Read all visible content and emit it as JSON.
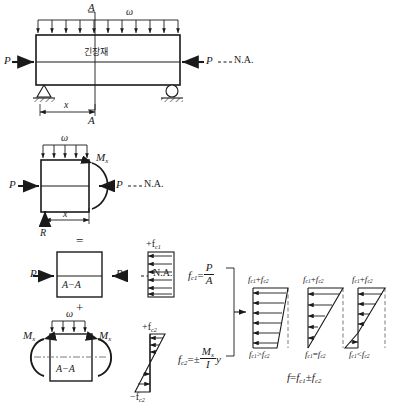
{
  "figure": {
    "line_color": "#1a1a1a",
    "dash_color": "#6b6b6b"
  },
  "beam_top": {
    "load_label": "ω",
    "section_label_top": "A",
    "section_label_bottom": "A",
    "tendon_label": "긴장재",
    "force_left": "P",
    "force_right": "P",
    "neutral_axis": "N.A.",
    "dimension": "x",
    "load_arrow_count": 11
  },
  "freebody": {
    "load_label": "ω",
    "moment_label": "M",
    "moment_sub": "x",
    "force_left": "P",
    "force_right": "P",
    "neutral_axis": "N.A.",
    "dimension": "x",
    "reaction": "R"
  },
  "operators": {
    "equals": "=",
    "plus": "+"
  },
  "axial_case": {
    "section_label": "A−A",
    "force_left": "P",
    "force_right": "P",
    "neutral_axis": "N.A.",
    "stress_label": "+f",
    "stress_sub": "c1",
    "arrow_count": 6
  },
  "bending_case": {
    "load_label": "ω",
    "section_label": "A−A",
    "moment_left": "M",
    "moment_left_sub": "x",
    "moment_right": "M",
    "moment_right_sub": "x",
    "stress_top": "+f",
    "stress_top_sub": "c2",
    "stress_bottom": "−f",
    "stress_bottom_sub": "c2",
    "arrow_count": 5
  },
  "formulas": {
    "axial": {
      "lhs": "f",
      "lhs_sub": "c1",
      "eq": "=",
      "num": "P",
      "den": "A"
    },
    "bending": {
      "lhs": "f",
      "lhs_sub": "c2",
      "eq": "=",
      "sign": "±",
      "num": "M",
      "num_sub": "x",
      "den": "I",
      "tail": "y"
    },
    "result": {
      "lhs": "f",
      "eq": "=",
      "t1": "f",
      "t1_sub": "c1",
      "op": "±",
      "t2": "f",
      "t2_sub": "c2"
    }
  },
  "results": [
    {
      "id": "case-a",
      "top_label": "f",
      "top_sub1": "c1",
      "top_op": "+",
      "top_sub2": "c2",
      "top_term2": "f",
      "bottom_left": "f",
      "bottom_left_sub": "c1",
      "bottom_rel": ">",
      "bottom_right": "f",
      "bottom_right_sub": "c2",
      "shape": "trapezoid-all-compression",
      "arrow_count": 6
    },
    {
      "id": "case-b",
      "top_label": "f",
      "top_sub1": "c1",
      "top_op": "+",
      "top_sub2": "c2",
      "top_term2": "f",
      "bottom_left": "f",
      "bottom_left_sub": "c1",
      "bottom_rel": "=",
      "bottom_right": "f",
      "bottom_right_sub": "c2",
      "shape": "triangle-zero-at-bottom",
      "arrow_count": 5
    },
    {
      "id": "case-c",
      "top_label": "f",
      "top_sub1": "c1",
      "top_op": "+",
      "top_sub2": "c2",
      "top_term2": "f",
      "bottom_left": "f",
      "bottom_left_sub": "c1",
      "bottom_rel": "<",
      "bottom_right": "f",
      "bottom_right_sub": "c2",
      "shape": "sign-reversal-tension-bottom",
      "arrow_count": 5
    }
  ]
}
